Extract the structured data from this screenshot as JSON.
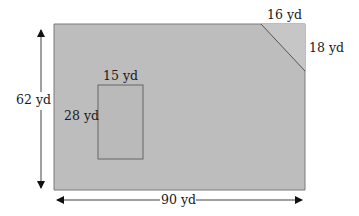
{
  "diagram": {
    "type": "area-figure",
    "units": "yd",
    "fill_color": "#bdbdbd",
    "stroke_color": "#6b6b6b",
    "outer_rectangle": {
      "width_label": "90 yd",
      "height_label": "62 yd"
    },
    "corner_cutout": {
      "top_label": "16 yd",
      "side_label": "18 yd"
    },
    "inner_rectangle": {
      "width_label": "15 yd",
      "height_label": "28 yd"
    }
  }
}
